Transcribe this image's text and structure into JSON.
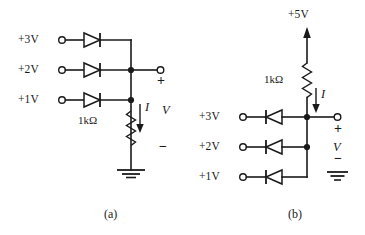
{
  "figure": {
    "type": "circuit-diagram",
    "background_color": "#ffffff",
    "line_color": "#1a1a1a"
  },
  "circuit_a": {
    "caption": "(a)",
    "sources": [
      {
        "label": "+3V"
      },
      {
        "label": "+2V"
      },
      {
        "label": "+1V"
      }
    ],
    "diode_direction": "right",
    "resistor": {
      "label": "1kΩ",
      "orientation": "vertical"
    },
    "current_label": "I",
    "voltage_label": "V",
    "plus_sign": "+",
    "minus_sign": "−",
    "ground": "earth-ground"
  },
  "circuit_b": {
    "caption": "(b)",
    "supply": {
      "label": "+5V"
    },
    "sources": [
      {
        "label": "+3V"
      },
      {
        "label": "+2V"
      },
      {
        "label": "+1V"
      }
    ],
    "diode_direction": "left",
    "resistor": {
      "label": "1kΩ",
      "orientation": "vertical"
    },
    "current_label": "I",
    "voltage_label": "V",
    "plus_sign": "+",
    "minus_sign": "−",
    "ground": "earth-ground"
  }
}
